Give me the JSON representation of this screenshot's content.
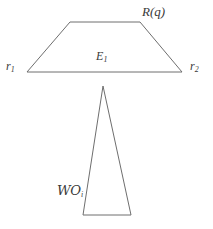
{
  "figure": {
    "background_color": "#ffffff",
    "stroke_color": "#6e6e6e",
    "text_color": "#3a3a3a",
    "width": 213,
    "height": 229,
    "shapes": [
      {
        "name": "trapezoid",
        "type": "polygon",
        "points": "70,22 140,22 182,72 27,72",
        "closed": true
      },
      {
        "name": "tall-triangle",
        "type": "polygon",
        "points": "103,86 131,215 83,215",
        "closed": true
      }
    ],
    "labels": [
      {
        "id": "label-rq",
        "name": "label-r-of-q",
        "base": "R",
        "open_paren": "(",
        "arg": "q",
        "close_paren": ")"
      },
      {
        "id": "label-r1",
        "name": "label-r-one",
        "base": "r",
        "subscript": "1"
      },
      {
        "id": "label-e1",
        "name": "label-e-one",
        "base": "E",
        "subscript": "1"
      },
      {
        "id": "label-r2",
        "name": "label-r-two",
        "base": "r",
        "subscript": "2"
      },
      {
        "id": "label-woi",
        "name": "label-script-wo-i",
        "base": "WO",
        "subscript": "i"
      }
    ]
  },
  "labels": {
    "rq": {
      "base": "R",
      "open_paren": "(",
      "arg": "q",
      "close_paren": ")"
    },
    "r1": {
      "base": "r",
      "subscript": "1"
    },
    "e1": {
      "base": "E",
      "subscript": "1"
    },
    "r2": {
      "base": "r",
      "subscript": "2"
    },
    "woi": {
      "base": "ᵂᴼ",
      "script_base": "WO",
      "subscript": "i"
    }
  }
}
